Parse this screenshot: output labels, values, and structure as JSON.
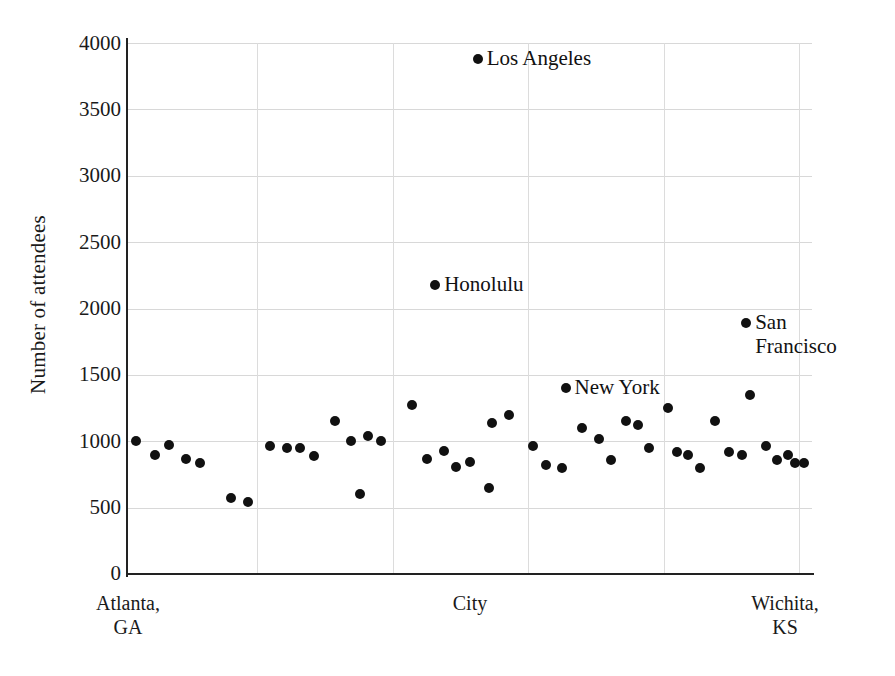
{
  "chart_data": {
    "type": "scatter",
    "title": "",
    "xlabel": "City",
    "ylabel": "Number of attendees",
    "ylim": [
      0,
      4000
    ],
    "yticks": [
      0,
      500,
      1000,
      1500,
      2000,
      2500,
      3000,
      3500,
      4000
    ],
    "ytick_labels": [
      "0",
      "500",
      "1000",
      "1500",
      "2000",
      "2500",
      "3000",
      "3500",
      "4000"
    ],
    "grid": true,
    "legend": "none",
    "x_axis_type": "categorical-ordered",
    "x_left_label": "Atlanta,\nGA",
    "x_mid_label": "City",
    "x_right_label": "Wichita,\nKS",
    "x_left_label_line1": "Atlanta,",
    "x_left_label_line2": "GA",
    "x_right_label_line1": "Wichita,",
    "x_right_label_line2": "KS",
    "xlim": [
      0,
      53
    ],
    "marker": "filled-circle",
    "marker_color": "#111111",
    "grid_color": "#d8d8d8",
    "axis_color": "#222222",
    "x_gridline_positions": [
      10,
      20.5,
      31,
      41.5,
      52
    ],
    "points": [
      {
        "x": 0.6,
        "y": 1000
      },
      {
        "x": 2.1,
        "y": 900
      },
      {
        "x": 3.2,
        "y": 970
      },
      {
        "x": 4.5,
        "y": 870
      },
      {
        "x": 5.6,
        "y": 840
      },
      {
        "x": 8.0,
        "y": 575
      },
      {
        "x": 9.3,
        "y": 545
      },
      {
        "x": 11.0,
        "y": 965
      },
      {
        "x": 12.3,
        "y": 950
      },
      {
        "x": 13.3,
        "y": 950
      },
      {
        "x": 14.4,
        "y": 890
      },
      {
        "x": 16.0,
        "y": 1150
      },
      {
        "x": 17.3,
        "y": 1000
      },
      {
        "x": 18.6,
        "y": 1040
      },
      {
        "x": 19.6,
        "y": 1000
      },
      {
        "x": 18.0,
        "y": 600
      },
      {
        "x": 22.0,
        "y": 1270
      },
      {
        "x": 23.2,
        "y": 870
      },
      {
        "x": 24.5,
        "y": 925
      },
      {
        "x": 25.4,
        "y": 805
      },
      {
        "x": 26.5,
        "y": 845
      },
      {
        "x": 28.2,
        "y": 1140
      },
      {
        "x": 28.0,
        "y": 650
      },
      {
        "x": 29.5,
        "y": 1200
      },
      {
        "x": 31.4,
        "y": 965
      },
      {
        "x": 32.4,
        "y": 820
      },
      {
        "x": 33.6,
        "y": 800
      },
      {
        "x": 35.2,
        "y": 1100
      },
      {
        "x": 36.5,
        "y": 1020
      },
      {
        "x": 37.4,
        "y": 860
      },
      {
        "x": 38.6,
        "y": 1155
      },
      {
        "x": 39.5,
        "y": 1120
      },
      {
        "x": 40.4,
        "y": 950
      },
      {
        "x": 41.8,
        "y": 1250
      },
      {
        "x": 42.5,
        "y": 920
      },
      {
        "x": 43.4,
        "y": 900
      },
      {
        "x": 44.3,
        "y": 800
      },
      {
        "x": 45.5,
        "y": 1150
      },
      {
        "x": 46.6,
        "y": 920
      },
      {
        "x": 47.6,
        "y": 900
      },
      {
        "x": 48.2,
        "y": 1350
      },
      {
        "x": 49.4,
        "y": 965
      },
      {
        "x": 50.3,
        "y": 860
      },
      {
        "x": 51.1,
        "y": 900
      },
      {
        "x": 51.7,
        "y": 840
      },
      {
        "x": 52.4,
        "y": 840
      }
    ],
    "annotated_points": [
      {
        "label": "Los Angeles",
        "x": 27.1,
        "y": 3880
      },
      {
        "label": "Honolulu",
        "x": 23.8,
        "y": 2175
      },
      {
        "label": "San Francisco",
        "x": 47.9,
        "y": 1890
      },
      {
        "label": "New York",
        "x": 33.9,
        "y": 1400
      }
    ]
  },
  "annotations": {
    "los_angeles": "Los Angeles",
    "honolulu": "Honolulu",
    "san_francisco_line1": "San",
    "san_francisco_line2": "Francisco",
    "new_york": "New York"
  },
  "axis": {
    "y_title": "Number of attendees",
    "x_title": "City",
    "y_tick_4000": "4000",
    "y_tick_3500": "3500",
    "y_tick_3000": "3000",
    "y_tick_2500": "2500",
    "y_tick_2000": "2000",
    "y_tick_1500": "1500",
    "y_tick_1000": "1000",
    "y_tick_500": "500",
    "y_tick_0": "0",
    "x_left": "Atlanta,\nGA",
    "x_right": "Wichita,\nKS"
  }
}
